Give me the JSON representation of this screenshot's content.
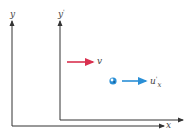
{
  "diagram": {
    "frame_s": {
      "y_axis_label": "y",
      "x_axis_label": "x"
    },
    "frame_s_prime": {
      "y_axis_label": "y",
      "y_axis_prime": "'"
    },
    "frame_velocity": {
      "label": "v",
      "color": "#d9304f"
    },
    "particle_velocity": {
      "label": "u",
      "prime": "'",
      "subscript": "x",
      "color": "#2a8fd6"
    },
    "particle": {
      "color": "#2a8fd6"
    },
    "axis_color": "#333333"
  }
}
